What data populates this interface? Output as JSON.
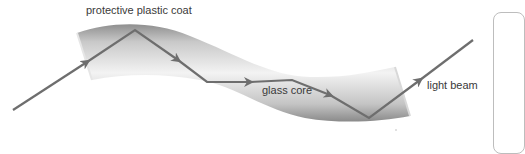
{
  "diagram": {
    "labels": {
      "coat": "protective plastic coat",
      "core": "glass core",
      "beam": "light beam"
    },
    "colors": {
      "beam": "#6e6e6e",
      "fiber_edge": "#9a9a9a",
      "fiber_center": "#f2f2f2",
      "label_text": "#3a3a3a",
      "panel_border": "#bdbdbd"
    },
    "beam_path": [
      [
        13,
        110
      ],
      [
        135,
        30
      ],
      [
        207,
        82
      ],
      [
        292,
        80
      ],
      [
        369,
        118
      ],
      [
        473,
        40
      ]
    ],
    "arrowheads": [
      [
        87,
        62
      ],
      [
        178,
        60
      ],
      [
        250,
        82
      ],
      [
        330,
        95
      ],
      [
        420,
        80
      ]
    ]
  }
}
